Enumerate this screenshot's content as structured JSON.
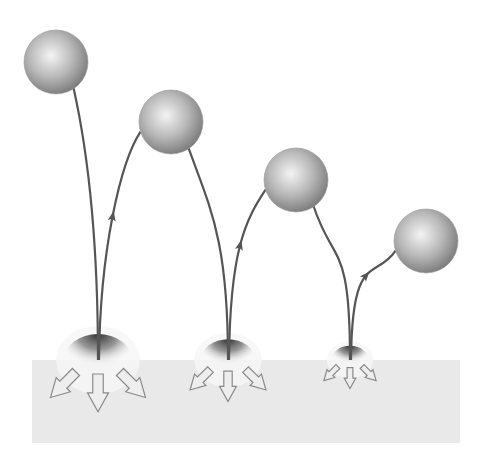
{
  "diagram": {
    "type": "bouncing-ball-energy-loss",
    "background": "#ffffff",
    "ground": {
      "x": 32,
      "y": 360,
      "width": 428,
      "height": 83,
      "color": "#e9e9e9"
    },
    "trajectory_color": "#555555",
    "ball_colors": {
      "highlight": "#f4f4f4",
      "mid": "#b8b8b8",
      "shadow": "#7c7c7c"
    },
    "balls": [
      {
        "cx": 56,
        "cy": 62,
        "r": 32
      },
      {
        "cx": 171,
        "cy": 122,
        "r": 32
      },
      {
        "cx": 296,
        "cy": 180,
        "r": 32
      },
      {
        "cx": 426,
        "cy": 241,
        "r": 32
      }
    ],
    "impacts": [
      {
        "x": 98,
        "scale": 1.0
      },
      {
        "x": 228,
        "scale": 0.8
      },
      {
        "x": 350,
        "scale": 0.55
      }
    ]
  }
}
